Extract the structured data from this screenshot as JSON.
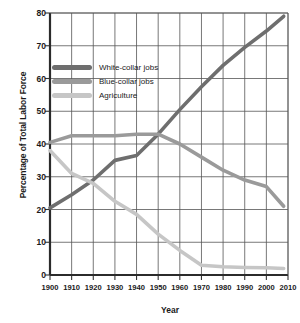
{
  "chart_data": {
    "type": "line",
    "title": "",
    "xlabel": "Year",
    "ylabel": "Percentage of Total Labor Force",
    "xlim": [
      1900,
      2010
    ],
    "ylim": [
      0,
      80
    ],
    "grid": true,
    "legend_position": "upper-left-inside",
    "xticks": [
      1900,
      1910,
      1920,
      1930,
      1940,
      1950,
      1960,
      1970,
      1980,
      1990,
      2000,
      2010
    ],
    "yticks": [
      0,
      10,
      20,
      30,
      40,
      50,
      60,
      70,
      80
    ],
    "x": [
      1900,
      1910,
      1920,
      1930,
      1940,
      1950,
      1960,
      1970,
      1980,
      1990,
      2000,
      2008
    ],
    "series": [
      {
        "name": "White-collar jobs",
        "color": "#6e6e6e",
        "values": [
          20.5,
          24.5,
          29.0,
          35.0,
          36.5,
          43.0,
          50.5,
          57.5,
          64.0,
          69.5,
          74.5,
          79.0
        ]
      },
      {
        "name": "Blue-collar jobs",
        "color": "#9a9a9a",
        "values": [
          40.5,
          42.5,
          42.5,
          42.5,
          43.0,
          43.0,
          40.0,
          36.0,
          32.0,
          29.0,
          27.0,
          21.0
        ]
      },
      {
        "name": "Agriculture",
        "color": "#c6c6c6",
        "values": [
          38.0,
          31.0,
          28.0,
          22.5,
          18.5,
          12.5,
          7.5,
          3.0,
          2.5,
          2.3,
          2.2,
          2.0
        ]
      }
    ]
  },
  "colors": {
    "axis": "#333333",
    "grid": "#555555",
    "text": "#1a1a1a",
    "background": "#ffffff",
    "white_collar": "#6e6e6e",
    "blue_collar": "#9a9a9a",
    "agriculture": "#c6c6c6"
  }
}
